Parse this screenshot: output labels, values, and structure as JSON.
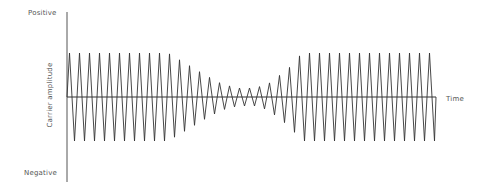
{
  "diagram": {
    "title": "",
    "labels": {
      "positive": "Positive",
      "negative": "Negative",
      "y_axis": "Carrier amplitude",
      "x_axis": "Time"
    },
    "colors": {
      "axis": "#555555",
      "wave": "#333333",
      "text": "#555555"
    },
    "geometry": {
      "y_axis_x": 67,
      "y_axis_top": 12,
      "y_axis_bottom": 182,
      "time_axis_y": 97,
      "time_axis_start": 67,
      "time_axis_end": 436
    },
    "waveform": {
      "type": "amplitude-modulated triangle carrier",
      "x_start": 67,
      "x_end": 436,
      "period_px": 10,
      "full_amplitude_px": 44,
      "envelope": [
        {
          "x": 67,
          "amp": 44
        },
        {
          "x": 168,
          "amp": 44
        },
        {
          "x": 185,
          "amp": 34
        },
        {
          "x": 205,
          "amp": 22
        },
        {
          "x": 222,
          "amp": 13
        },
        {
          "x": 238,
          "amp": 9
        },
        {
          "x": 255,
          "amp": 9
        },
        {
          "x": 268,
          "amp": 13
        },
        {
          "x": 280,
          "amp": 22
        },
        {
          "x": 290,
          "amp": 30
        },
        {
          "x": 302,
          "amp": 44
        },
        {
          "x": 436,
          "amp": 44
        }
      ]
    }
  }
}
